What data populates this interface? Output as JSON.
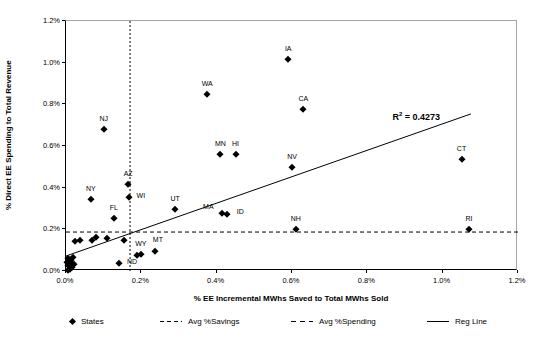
{
  "chart_data": {
    "type": "scatter",
    "title": "",
    "xlabel": "% EE Incremental MWhs Saved to Total MWhs Sold",
    "ylabel": "% Direct EE Spending to Total Revenue",
    "xlim": [
      0,
      1.2
    ],
    "ylim": [
      0,
      1.2
    ],
    "x_tick_values": [
      0,
      0.2,
      0.4,
      0.6,
      0.8,
      1.0,
      1.2
    ],
    "x_tick_labels": [
      "0.0%",
      "0.2%",
      "0.4%",
      "0.6%",
      "0.8%",
      "1.0%",
      "1.2%"
    ],
    "y_tick_values": [
      0,
      0.2,
      0.4,
      0.6,
      0.8,
      1.0,
      1.2
    ],
    "y_tick_labels": [
      "0.0%",
      "0.2%",
      "0.4%",
      "0.6%",
      "0.8%",
      "1.0%",
      "1.2%"
    ],
    "marker_color": "#000000",
    "grid": false,
    "points": [
      {
        "label": "IA",
        "x": 0.59,
        "y": 1.02
      },
      {
        "label": "WA",
        "x": 0.375,
        "y": 0.85
      },
      {
        "label": "CA",
        "x": 0.63,
        "y": 0.78
      },
      {
        "label": "NJ",
        "x": 0.1,
        "y": 0.68
      },
      {
        "label": "MN",
        "x": 0.41,
        "y": 0.56
      },
      {
        "label": "HI",
        "x": 0.45,
        "y": 0.562
      },
      {
        "label": "NV",
        "x": 0.6,
        "y": 0.5
      },
      {
        "label": "CT",
        "x": 1.05,
        "y": 0.54
      },
      {
        "label": "AZ",
        "x": 0.165,
        "y": 0.42
      },
      {
        "label": "WI",
        "x": 0.167,
        "y": 0.355,
        "dx": 12,
        "dy": -2
      },
      {
        "label": "NY",
        "x": 0.066,
        "y": 0.345
      },
      {
        "label": "UT",
        "x": 0.29,
        "y": 0.3
      },
      {
        "label": "MA",
        "x": 0.415,
        "y": 0.28,
        "dx": -14,
        "dy": -7
      },
      {
        "label": "ID",
        "x": 0.428,
        "y": 0.272,
        "dx": 13,
        "dy": -3
      },
      {
        "label": "FL",
        "x": 0.127,
        "y": 0.255
      },
      {
        "label": "NH",
        "x": 0.61,
        "y": 0.2
      },
      {
        "label": "RI",
        "x": 1.07,
        "y": 0.2
      },
      {
        "label": "MT",
        "x": 0.236,
        "y": 0.096,
        "dx": 3,
        "dy": -12
      },
      {
        "label": "WY",
        "x": 0.188,
        "y": 0.078,
        "dx": 4,
        "dy": -12
      },
      {
        "label": "",
        "x": 0.198,
        "y": 0.084
      },
      {
        "label": "ND",
        "x": 0.141,
        "y": 0.038,
        "dx": 13,
        "dy": -2
      },
      {
        "label": "",
        "x": 0.025,
        "y": 0.144
      },
      {
        "label": "",
        "x": 0.038,
        "y": 0.15
      },
      {
        "label": "",
        "x": 0.068,
        "y": 0.15
      },
      {
        "label": "",
        "x": 0.079,
        "y": 0.162
      },
      {
        "label": "",
        "x": 0.11,
        "y": 0.158
      },
      {
        "label": "",
        "x": 0.155,
        "y": 0.15
      },
      {
        "label": "",
        "x": 0.004,
        "y": 0.005
      },
      {
        "label": "",
        "x": 0.01,
        "y": 0.012
      },
      {
        "label": "",
        "x": 0.016,
        "y": 0.02
      },
      {
        "label": "",
        "x": 0.006,
        "y": 0.028
      },
      {
        "label": "",
        "x": 0.02,
        "y": 0.035
      },
      {
        "label": "",
        "x": 0.003,
        "y": 0.045
      },
      {
        "label": "",
        "x": 0.014,
        "y": 0.04
      },
      {
        "label": "",
        "x": 0.012,
        "y": 0.055
      },
      {
        "label": "",
        "x": 0.006,
        "y": 0.062
      },
      {
        "label": "",
        "x": 0.018,
        "y": 0.065
      }
    ],
    "reg_line": {
      "x1": 0.0,
      "y1": 0.072,
      "x2": 1.075,
      "y2": 0.754
    },
    "avg_savings_x": 0.17,
    "avg_spending_y": 0.187,
    "r_squared": "0.4273",
    "annotation": {
      "base": "R",
      "sup": "2",
      "rest": " = 0.4273",
      "x": 0.93,
      "y": 0.742
    }
  },
  "legend": {
    "items": [
      {
        "label": "States",
        "marker": "diamond",
        "left": 70
      },
      {
        "label": "Avg %Savings",
        "marker": "dash-small",
        "left": 160
      },
      {
        "label": "Avg %Spending",
        "marker": "dash-large",
        "left": 291
      },
      {
        "label": "Reg Line",
        "marker": "solid-line",
        "left": 427
      }
    ]
  }
}
